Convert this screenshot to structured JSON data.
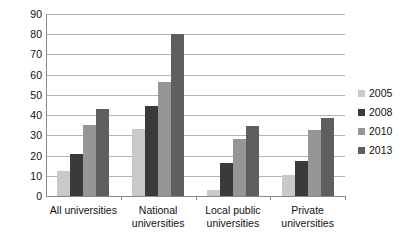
{
  "chart_data": {
    "type": "bar",
    "title": "",
    "subtitle": "",
    "xlabel": "",
    "ylabel": "",
    "ylim": [
      0,
      90
    ],
    "ytick_step": 10,
    "yticks": [
      90,
      80,
      70,
      60,
      50,
      40,
      30,
      20,
      10,
      0
    ],
    "grid": true,
    "legend_position": "right",
    "categories": [
      "All universities",
      "National universities",
      "Local public universities",
      "Private universities"
    ],
    "category_lines": [
      [
        "All universities"
      ],
      [
        "National",
        "universities"
      ],
      [
        "Local public",
        "universities"
      ],
      [
        "Private",
        "universities"
      ]
    ],
    "series": [
      {
        "name": "2005",
        "color": "#c9c9c9",
        "values": [
          12.5,
          33,
          3,
          10.5
        ]
      },
      {
        "name": "2008",
        "color": "#3a3a3a",
        "values": [
          21,
          44.5,
          16.5,
          17.5
        ]
      },
      {
        "name": "2010",
        "color": "#969696",
        "values": [
          35,
          56.5,
          28,
          32.5
        ]
      },
      {
        "name": "2013",
        "color": "#5e5e5e",
        "values": [
          43,
          80,
          34.5,
          38.5
        ]
      }
    ]
  },
  "axis": {
    "line_color": "#8a8a8a",
    "grid_color": "#b4b4b4"
  }
}
